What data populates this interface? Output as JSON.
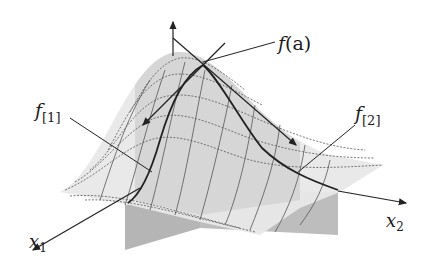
{
  "diagram": {
    "type": "3d-surface-with-partial-slices",
    "labels": {
      "point_value": "f(a)",
      "point_value_main": "f",
      "point_value_arg": "(a)",
      "slice1_main": "f",
      "slice1_sub": "[1]",
      "slice2_main": "f",
      "slice2_sub": "[2]",
      "axis1_main": "x",
      "axis1_sub": "1",
      "axis2_main": "x",
      "axis2_sub": "2"
    },
    "colors": {
      "surface_light": "#ececec",
      "surface_mid": "#d6d6d6",
      "slice_plane": "#b8b8b8",
      "grid": "#555555",
      "curve": "#222222",
      "axis": "#222222"
    }
  }
}
